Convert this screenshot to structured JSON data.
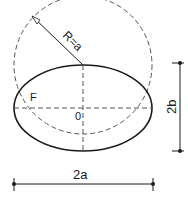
{
  "diagram": {
    "type": "ellipse-construction",
    "labels": {
      "radius": "R=a",
      "focus": "F",
      "center": "0",
      "height_dim": "2b",
      "width_dim": "2a"
    },
    "colors": {
      "stroke": "#1a1a1a",
      "dashed": "#555555",
      "background": "#ffffff"
    }
  }
}
